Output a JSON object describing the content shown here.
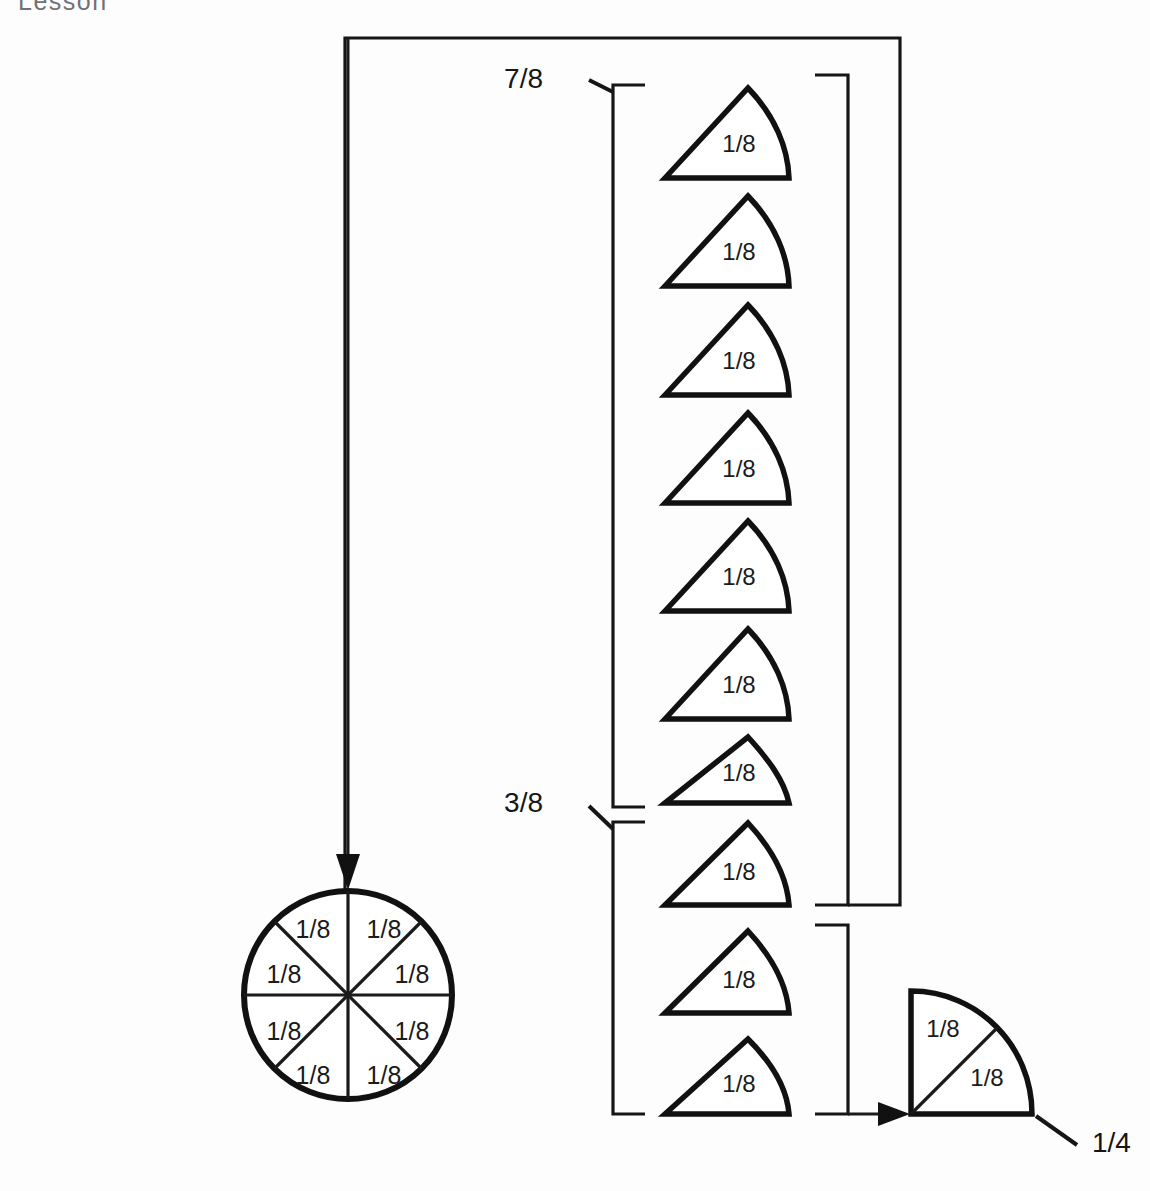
{
  "page": {
    "clipped_header_text": "Lesson",
    "background_color": "#fdfdfd",
    "ink_color": "#111111",
    "width": 1150,
    "height": 1191
  },
  "whole_circle": {
    "name": "whole-circle",
    "center": {
      "x": 348,
      "y": 995
    },
    "radius": 104,
    "sector_count": 8,
    "sector_labels": [
      "1/8",
      "1/8",
      "1/8",
      "1/8",
      "1/8",
      "1/8",
      "1/8",
      "1/8"
    ],
    "label_positions": [
      {
        "x": 313,
        "y": 930,
        "label": "1/8"
      },
      {
        "x": 383,
        "y": 930,
        "label": "1/8"
      },
      {
        "x": 285,
        "y": 977,
        "label": "1/8"
      },
      {
        "x": 411,
        "y": 977,
        "label": "1/8"
      },
      {
        "x": 285,
        "y": 1020,
        "label": "1/8"
      },
      {
        "x": 411,
        "y": 1020,
        "label": "1/8"
      },
      {
        "x": 313,
        "y": 1063,
        "label": "1/8"
      },
      {
        "x": 383,
        "y": 1063,
        "label": "1/8"
      }
    ]
  },
  "sector_column": {
    "name": "separated-eighths-column",
    "count": 10,
    "labels": [
      "1/8",
      "1/8",
      "1/8",
      "1/8",
      "1/8",
      "1/8",
      "1/8",
      "1/8",
      "1/8",
      "1/8"
    ],
    "tops": [
      88,
      196,
      305,
      413,
      521,
      629,
      737,
      823,
      931,
      1039
    ]
  },
  "quarter_piece": {
    "name": "quarter-circle-piece",
    "sector_labels": [
      "1/8",
      "1/8"
    ],
    "result_label": "1/4",
    "result_label_position": {
      "x": 1092,
      "y": 1139
    }
  },
  "group_brackets": [
    {
      "name": "bracket-seven-eighths",
      "label": "7/8",
      "label_position": {
        "x": 543,
        "y": 88
      },
      "covers_sectors": 8,
      "span": {
        "top": 85,
        "bottom": 807
      }
    },
    {
      "name": "bracket-three-eighths",
      "label": "3/8",
      "label_position": {
        "x": 543,
        "y": 812
      },
      "covers_sectors": 3,
      "span": {
        "top": 822,
        "bottom": 1114
      }
    }
  ],
  "arrows": [
    {
      "name": "arrow-to-whole-circle",
      "direction": "down",
      "from": {
        "x": 348,
        "y": 40
      },
      "to": {
        "x": 348,
        "y": 888
      }
    },
    {
      "name": "arrow-to-quarter-piece",
      "direction": "right",
      "from": {
        "x": 846,
        "y": 1114
      },
      "to": {
        "x": 908,
        "y": 1114
      }
    }
  ],
  "annotations": {
    "outer_loop_name": "outer-routing-line",
    "right_group_bracket_name": "right-bracket-seven-eighths",
    "right_lower_bracket_name": "right-bracket-two-eighths"
  }
}
